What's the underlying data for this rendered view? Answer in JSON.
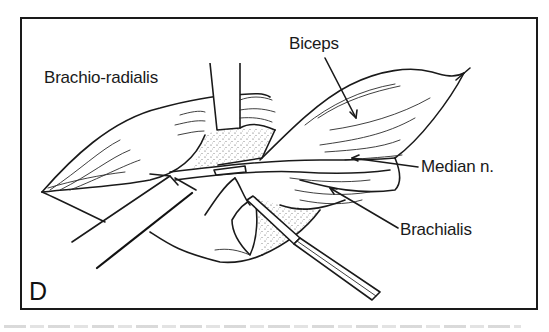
{
  "figure": {
    "panel_letter": "D",
    "labels": {
      "brachioradialis": "Brachio-radialis",
      "biceps": "Biceps",
      "median_nerve": "Median n.",
      "brachialis": "Brachialis"
    },
    "colors": {
      "ink": "#1a1a1a",
      "background": "#ffffff",
      "stipple": "#555555"
    }
  }
}
